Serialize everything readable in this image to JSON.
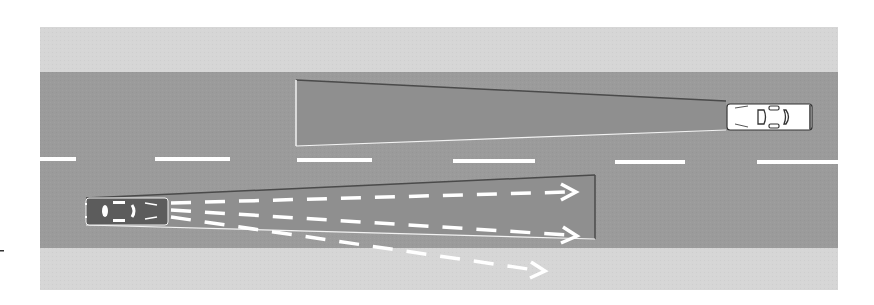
{
  "diagram": {
    "title": "Blind spot / field of view diagram on a two-lane road",
    "colors": {
      "background": "#ffffff",
      "shoulder": "#d6d6d6",
      "road": "#9b9b9b",
      "zone_fill": "#8f8f8f",
      "zone_edge_dark": "#4a4a4a",
      "zone_edge_light": "#f2f2f2",
      "lane_marking": "#ffffff",
      "car_dark": "#5c5c5c",
      "car_light": "#ffffff",
      "tick_mark": "#333333"
    },
    "road": {
      "x": 40,
      "width": 798,
      "top_shoulder": {
        "y": 27,
        "height": 45
      },
      "carriageway": {
        "y": 72,
        "height": 176
      },
      "bottom_shoulder": {
        "y": 248,
        "height": 42
      },
      "center_line_y": 159,
      "center_dashes": [
        [
          40,
          76
        ],
        [
          155,
          230
        ],
        [
          297,
          372
        ],
        [
          453,
          535
        ],
        [
          615,
          685
        ],
        [
          757,
          838
        ]
      ]
    },
    "vehicles": [
      {
        "name": "oncoming-car",
        "color": "light",
        "x": 726,
        "y": 103,
        "width": 86,
        "height": 27,
        "facing": "left"
      },
      {
        "name": "own-car",
        "color": "dark",
        "x": 86,
        "y": 198,
        "width": 82,
        "height": 27,
        "facing": "right"
      }
    ],
    "zones": [
      {
        "name": "oncoming-car-view-zone",
        "points": "296,80 726,101 726,130 296,146"
      },
      {
        "name": "own-car-view-zone",
        "points": "86,198 595,175 595,239 86,225"
      }
    ],
    "sight_lines": [
      {
        "name": "sight-line-straight",
        "from": [
          170,
          205
        ],
        "to": [
          578,
          190
        ],
        "arrow": true
      },
      {
        "name": "sight-line-mid",
        "from": [
          170,
          212
        ],
        "to": [
          578,
          236
        ],
        "arrow": true
      },
      {
        "name": "sight-line-wide",
        "from": [
          170,
          219
        ],
        "to": [
          545,
          271
        ],
        "arrow": true
      }
    ]
  }
}
